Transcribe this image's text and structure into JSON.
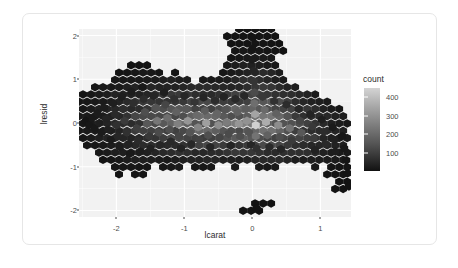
{
  "chart_data": {
    "type": "heatmap",
    "subtype": "hexbin",
    "title": "",
    "xlabel": "lcarat",
    "ylabel": "lresid",
    "xlim": [
      -2.55,
      1.45
    ],
    "ylim": [
      -2.15,
      2.15
    ],
    "xticks": [
      "-2",
      "-1",
      "0",
      "1"
    ],
    "xtick_values": [
      -2,
      -1,
      0,
      1
    ],
    "yticks": [
      "2",
      "1",
      "0",
      "-1",
      "-2"
    ],
    "ytick_values": [
      2,
      1,
      0,
      -1,
      -2
    ],
    "grid": true,
    "panel_background": "#f2f2f2",
    "gridline_color": "#ffffff",
    "legend": {
      "title": "count",
      "position": "right",
      "type": "continuous-gradient",
      "ticks": [
        "400",
        "300",
        "200",
        "100"
      ],
      "tick_values": [
        400,
        300,
        200,
        100
      ],
      "range": [
        0,
        450
      ],
      "low_color": "#111111",
      "high_color": "#d9d9d9"
    },
    "bins": [
      {
        "x": -2.45,
        "y": 0.05,
        "count": 10
      },
      {
        "x": -2.4,
        "y": -0.05,
        "count": 14
      },
      {
        "x": -2.35,
        "y": 0.12,
        "count": 18
      },
      {
        "x": -2.32,
        "y": -0.12,
        "count": 16
      },
      {
        "x": -2.28,
        "y": 0.22,
        "count": 24
      },
      {
        "x": -2.25,
        "y": 0.0,
        "count": 30
      },
      {
        "x": -2.22,
        "y": -0.22,
        "count": 22
      },
      {
        "x": -2.18,
        "y": 0.35,
        "count": 28
      },
      {
        "x": -2.15,
        "y": 0.1,
        "count": 40
      },
      {
        "x": -2.12,
        "y": -0.15,
        "count": 34
      },
      {
        "x": -2.08,
        "y": -0.38,
        "count": 20
      },
      {
        "x": -2.05,
        "y": 0.45,
        "count": 32
      },
      {
        "x": -2.02,
        "y": 0.2,
        "count": 55
      },
      {
        "x": -2.0,
        "y": -0.05,
        "count": 70
      },
      {
        "x": -1.98,
        "y": -0.3,
        "count": 48
      },
      {
        "x": -1.95,
        "y": -0.55,
        "count": 26
      },
      {
        "x": -1.92,
        "y": 0.6,
        "count": 30
      },
      {
        "x": -1.9,
        "y": 0.32,
        "count": 62
      },
      {
        "x": -1.88,
        "y": 0.05,
        "count": 95
      },
      {
        "x": -1.85,
        "y": -0.22,
        "count": 72
      },
      {
        "x": -1.82,
        "y": -0.48,
        "count": 38
      },
      {
        "x": -1.8,
        "y": -0.7,
        "count": 18
      },
      {
        "x": -1.78,
        "y": 0.72,
        "count": 24
      },
      {
        "x": -1.75,
        "y": 0.45,
        "count": 66
      },
      {
        "x": -1.72,
        "y": 0.15,
        "count": 120
      },
      {
        "x": -1.7,
        "y": -0.12,
        "count": 105
      },
      {
        "x": -1.68,
        "y": -0.4,
        "count": 58
      },
      {
        "x": -1.65,
        "y": -0.65,
        "count": 28
      },
      {
        "x": -1.62,
        "y": 0.82,
        "count": 18
      },
      {
        "x": -1.6,
        "y": 0.55,
        "count": 60
      },
      {
        "x": -1.58,
        "y": 0.25,
        "count": 140
      },
      {
        "x": -1.55,
        "y": -0.02,
        "count": 160
      },
      {
        "x": -1.52,
        "y": -0.3,
        "count": 88
      },
      {
        "x": -1.5,
        "y": -0.58,
        "count": 36
      },
      {
        "x": -1.45,
        "y": 0.62,
        "count": 44
      },
      {
        "x": -1.42,
        "y": 0.35,
        "count": 150
      },
      {
        "x": -1.4,
        "y": 0.05,
        "count": 230
      },
      {
        "x": -1.38,
        "y": -0.22,
        "count": 130
      },
      {
        "x": -1.35,
        "y": -0.5,
        "count": 48
      },
      {
        "x": -1.3,
        "y": 0.7,
        "count": 30
      },
      {
        "x": -1.28,
        "y": 0.42,
        "count": 120
      },
      {
        "x": -1.25,
        "y": 0.12,
        "count": 210
      },
      {
        "x": -1.22,
        "y": -0.15,
        "count": 140
      },
      {
        "x": -1.2,
        "y": -0.42,
        "count": 55
      },
      {
        "x": -1.15,
        "y": 0.55,
        "count": 70
      },
      {
        "x": -1.12,
        "y": 0.25,
        "count": 180
      },
      {
        "x": -1.1,
        "y": -0.02,
        "count": 250
      },
      {
        "x": -1.08,
        "y": -0.3,
        "count": 120
      },
      {
        "x": -1.05,
        "y": -0.58,
        "count": 40
      },
      {
        "x": -1.0,
        "y": 0.62,
        "count": 50
      },
      {
        "x": -0.98,
        "y": 0.32,
        "count": 160
      },
      {
        "x": -0.95,
        "y": 0.05,
        "count": 300
      },
      {
        "x": -0.92,
        "y": -0.22,
        "count": 150
      },
      {
        "x": -0.9,
        "y": -0.48,
        "count": 52
      },
      {
        "x": -0.85,
        "y": 0.48,
        "count": 80
      },
      {
        "x": -0.82,
        "y": 0.18,
        "count": 200
      },
      {
        "x": -0.8,
        "y": -0.1,
        "count": 260
      },
      {
        "x": -0.78,
        "y": -0.38,
        "count": 110
      },
      {
        "x": -0.72,
        "y": 0.58,
        "count": 46
      },
      {
        "x": -0.7,
        "y": 0.28,
        "count": 170
      },
      {
        "x": -0.68,
        "y": 0.0,
        "count": 320
      },
      {
        "x": -0.65,
        "y": -0.28,
        "count": 140
      },
      {
        "x": -0.62,
        "y": -0.55,
        "count": 44
      },
      {
        "x": -0.55,
        "y": 0.52,
        "count": 60
      },
      {
        "x": -0.52,
        "y": 0.22,
        "count": 190
      },
      {
        "x": -0.5,
        "y": -0.05,
        "count": 280
      },
      {
        "x": -0.48,
        "y": -0.32,
        "count": 120
      },
      {
        "x": -0.42,
        "y": 0.6,
        "count": 40
      },
      {
        "x": -0.4,
        "y": 0.3,
        "count": 150
      },
      {
        "x": -0.38,
        "y": 0.02,
        "count": 240
      },
      {
        "x": -0.35,
        "y": -0.25,
        "count": 130
      },
      {
        "x": -0.32,
        "y": -0.52,
        "count": 42
      },
      {
        "x": -0.25,
        "y": 0.55,
        "count": 55
      },
      {
        "x": -0.22,
        "y": 0.25,
        "count": 180
      },
      {
        "x": -0.2,
        "y": -0.02,
        "count": 300
      },
      {
        "x": -0.18,
        "y": -0.3,
        "count": 140
      },
      {
        "x": -0.12,
        "y": 0.62,
        "count": 50
      },
      {
        "x": -0.1,
        "y": 0.32,
        "count": 170
      },
      {
        "x": -0.08,
        "y": 0.05,
        "count": 290
      },
      {
        "x": -0.05,
        "y": -0.22,
        "count": 150
      },
      {
        "x": -0.02,
        "y": -0.5,
        "count": 48
      },
      {
        "x": 0.0,
        "y": 1.95,
        "count": 6
      },
      {
        "x": 0.0,
        "y": 1.7,
        "count": 10
      },
      {
        "x": 0.0,
        "y": 1.45,
        "count": 22
      },
      {
        "x": 0.02,
        "y": 1.2,
        "count": 45
      },
      {
        "x": 0.02,
        "y": 0.95,
        "count": 80
      },
      {
        "x": 0.03,
        "y": 0.7,
        "count": 130
      },
      {
        "x": 0.03,
        "y": 0.45,
        "count": 210
      },
      {
        "x": 0.04,
        "y": 0.2,
        "count": 330
      },
      {
        "x": 0.05,
        "y": -0.05,
        "count": 430
      },
      {
        "x": 0.05,
        "y": -0.3,
        "count": 220
      },
      {
        "x": 0.06,
        "y": -0.58,
        "count": 70
      },
      {
        "x": 0.06,
        "y": -1.95,
        "count": 4
      },
      {
        "x": 0.15,
        "y": 0.6,
        "count": 90
      },
      {
        "x": 0.18,
        "y": 0.3,
        "count": 200
      },
      {
        "x": 0.2,
        "y": 0.02,
        "count": 350
      },
      {
        "x": 0.22,
        "y": -0.28,
        "count": 180
      },
      {
        "x": 0.25,
        "y": -0.55,
        "count": 55
      },
      {
        "x": 0.32,
        "y": 0.5,
        "count": 70
      },
      {
        "x": 0.35,
        "y": 0.22,
        "count": 180
      },
      {
        "x": 0.38,
        "y": -0.05,
        "count": 280
      },
      {
        "x": 0.4,
        "y": -0.32,
        "count": 140
      },
      {
        "x": 0.42,
        "y": -0.6,
        "count": 44
      },
      {
        "x": 0.5,
        "y": 0.42,
        "count": 60
      },
      {
        "x": 0.52,
        "y": 0.15,
        "count": 150
      },
      {
        "x": 0.55,
        "y": -0.12,
        "count": 220
      },
      {
        "x": 0.58,
        "y": -0.4,
        "count": 95
      },
      {
        "x": 0.68,
        "y": 0.32,
        "count": 50
      },
      {
        "x": 0.7,
        "y": 0.05,
        "count": 120
      },
      {
        "x": 0.72,
        "y": -0.22,
        "count": 160
      },
      {
        "x": 0.75,
        "y": -0.5,
        "count": 60
      },
      {
        "x": 0.85,
        "y": 0.2,
        "count": 40
      },
      {
        "x": 0.88,
        "y": -0.08,
        "count": 90
      },
      {
        "x": 0.9,
        "y": -0.35,
        "count": 100
      },
      {
        "x": 0.92,
        "y": -0.62,
        "count": 38
      },
      {
        "x": 1.02,
        "y": 0.08,
        "count": 30
      },
      {
        "x": 1.05,
        "y": -0.2,
        "count": 60
      },
      {
        "x": 1.08,
        "y": -0.48,
        "count": 55
      },
      {
        "x": 1.18,
        "y": -0.1,
        "count": 20
      },
      {
        "x": 1.2,
        "y": -0.38,
        "count": 34
      },
      {
        "x": 1.22,
        "y": -0.65,
        "count": 26
      },
      {
        "x": 1.32,
        "y": -0.3,
        "count": 14
      },
      {
        "x": 1.35,
        "y": -0.58,
        "count": 16
      },
      {
        "x": 1.38,
        "y": -0.85,
        "count": 10
      },
      {
        "x": 1.4,
        "y": -1.15,
        "count": 6
      },
      {
        "x": 1.42,
        "y": -1.45,
        "count": 4
      }
    ]
  },
  "chart": {
    "xlabel": "lcarat",
    "ylabel": "lresid",
    "legend_title": "count"
  }
}
